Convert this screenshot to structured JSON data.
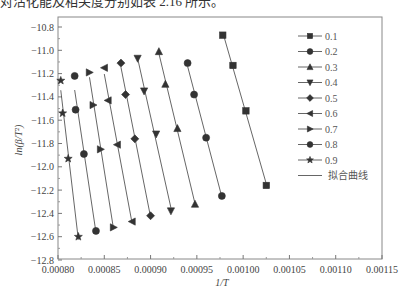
{
  "caption": "对活化能及相关度分别如表 2.16 所示。",
  "chart_data": {
    "type": "scatter",
    "title": "",
    "xlabel": "1/T",
    "ylabel": "ln(β/T²)",
    "xlim": [
      0.0008,
      0.00115
    ],
    "ylim": [
      -12.8,
      -10.8
    ],
    "xticks": [
      "0.00080",
      "0.00085",
      "0.00090",
      "0.00095",
      "0.00100",
      "0.00105",
      "0.00110",
      "0.00115"
    ],
    "yticks": [
      "-10.8",
      "-11.0",
      "-11.2",
      "-11.4",
      "-11.6",
      "-11.8",
      "-12.0",
      "-12.2",
      "-12.4",
      "-12.6",
      "-12.8"
    ],
    "grid": false,
    "legend_position": "upper right",
    "fit_line_label": "拟合曲线",
    "series": [
      {
        "name": "0.1",
        "marker": "square",
        "x": [
          0.000978,
          0.000989,
          0.001003,
          0.001025
        ],
        "y": [
          -10.87,
          -11.13,
          -11.52,
          -12.16
        ]
      },
      {
        "name": "0.2",
        "marker": "circle",
        "x": [
          0.00094,
          0.000947,
          0.00096,
          0.000977
        ],
        "y": [
          -11.11,
          -11.38,
          -11.75,
          -12.25
        ]
      },
      {
        "name": "0.3",
        "marker": "triangle-up",
        "x": [
          0.000909,
          0.000916,
          0.000929,
          0.000948
        ],
        "y": [
          -11.01,
          -11.29,
          -11.67,
          -12.32
        ]
      },
      {
        "name": "0.4",
        "marker": "triangle-down",
        "x": [
          0.000886,
          0.000893,
          0.000906,
          0.000922
        ],
        "y": [
          -11.07,
          -11.35,
          -11.72,
          -12.38
        ]
      },
      {
        "name": "0.5",
        "marker": "diamond",
        "x": [
          0.000868,
          0.000873,
          0.000883,
          0.0009
        ],
        "y": [
          -11.11,
          -11.38,
          -11.76,
          -12.42
        ]
      },
      {
        "name": "0.6",
        "marker": "triangle-left",
        "x": [
          0.00085,
          0.000854,
          0.000864,
          0.00088
        ],
        "y": [
          -11.15,
          -11.43,
          -11.81,
          -12.47
        ]
      },
      {
        "name": "0.7",
        "marker": "triangle-right",
        "x": [
          0.000834,
          0.000838,
          0.000846,
          0.00086
        ],
        "y": [
          -11.19,
          -11.47,
          -11.85,
          -12.52
        ]
      },
      {
        "name": "0.8",
        "marker": "hexagon",
        "x": [
          0.000818,
          0.000819,
          0.000828,
          0.000841
        ],
        "y": [
          -11.22,
          -11.51,
          -11.89,
          -12.55
        ]
      },
      {
        "name": "0.9",
        "marker": "star",
        "x": [
          0.000803,
          0.000805,
          0.000811,
          0.000822
        ],
        "y": [
          -11.26,
          -11.54,
          -11.93,
          -12.6
        ]
      }
    ]
  },
  "colors": {
    "marker": "#333333",
    "line": "#555555",
    "axis": "#666666"
  }
}
